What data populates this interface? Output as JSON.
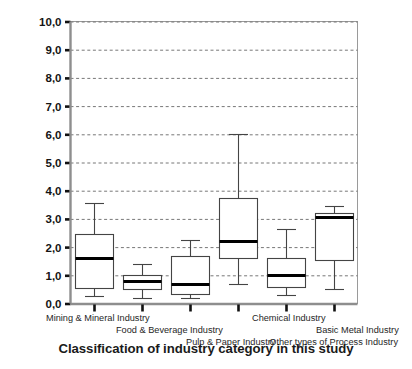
{
  "chart_data": {
    "type": "box",
    "title": "",
    "xlabel": "Classification of industry category in this study",
    "ylabel": "R&D intensity (R&D turnover/company turnover) in %",
    "ylim": [
      0.0,
      10.0
    ],
    "ytick_step": 1.0,
    "ytick_labels": [
      "0,0",
      "1,0",
      "2,0",
      "3,0",
      "4,0",
      "5,0",
      "6,0",
      "7,0",
      "8,0",
      "9,0",
      "10,0"
    ],
    "ytick_values": [
      0.0,
      1.0,
      2.0,
      3.0,
      4.0,
      5.0,
      6.0,
      7.0,
      8.0,
      9.0,
      10.0
    ],
    "grid": "horizontal-dashed",
    "legend": "none",
    "decimal_separator": ",",
    "categories": [
      "Mining & Mineral Industry",
      "Food & Beverage Industry",
      "Pulp & Paper Industry",
      "Chemical Industry",
      "Basic Metal Industry",
      "Other types of Process Industry"
    ],
    "boxes": [
      {
        "category": "Mining & Mineral Industry",
        "whisker_low": 0.25,
        "q1": 0.55,
        "median": 1.6,
        "q3": 2.45,
        "whisker_high": 3.55
      },
      {
        "category": "Food & Beverage Industry",
        "whisker_low": 0.2,
        "q1": 0.5,
        "median": 0.8,
        "q3": 1.0,
        "whisker_high": 1.4
      },
      {
        "category": "Pulp & Paper Industry",
        "whisker_low": 0.2,
        "q1": 0.35,
        "median": 0.7,
        "q3": 1.7,
        "whisker_high": 2.25
      },
      {
        "category": "Chemical Industry",
        "whisker_low": 0.7,
        "q1": 1.6,
        "median": 2.2,
        "q3": 3.75,
        "whisker_high": 6.0
      },
      {
        "category": "Basic Metal Industry",
        "whisker_low": 0.3,
        "q1": 0.6,
        "median": 1.0,
        "q3": 1.6,
        "whisker_high": 2.65
      },
      {
        "category": "Other types of Process Industry",
        "whisker_low": 0.5,
        "q1": 1.55,
        "median": 3.05,
        "q3": 3.2,
        "whisker_high": 3.45
      }
    ],
    "colors": {
      "box_stroke": "#444444",
      "median_stroke": "#000000",
      "grid": "#777777",
      "axis": "#555555",
      "background": "#ffffff"
    }
  }
}
